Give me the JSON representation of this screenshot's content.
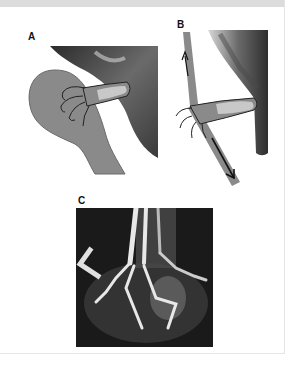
{
  "figure": {
    "panels": [
      {
        "label": "A",
        "description": "Foot resting on spoon-shaped support"
      },
      {
        "label": "B",
        "description": "Foot with stick and traction arrows"
      },
      {
        "label": "C",
        "description": "Radiograph of foot",
        "marker": "L"
      }
    ]
  },
  "colors": {
    "support": "#8a8a8a",
    "skin_dark": "#4a4a4a",
    "highlight": "#c8c8c8",
    "xray_bg": "#1a1a1a"
  }
}
